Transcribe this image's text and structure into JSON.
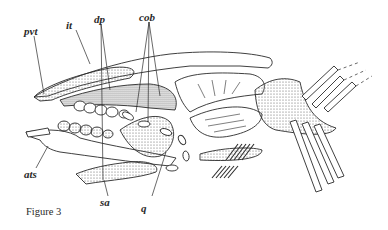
{
  "figure": {
    "caption": "Figure 3",
    "labels": [
      {
        "id": "pvt",
        "text": "pvt"
      },
      {
        "id": "it",
        "text": "it"
      },
      {
        "id": "dp",
        "text": "dp"
      },
      {
        "id": "cob",
        "text": "cob"
      },
      {
        "id": "ats",
        "text": "ats"
      },
      {
        "id": "sa",
        "text": "sa"
      },
      {
        "id": "q",
        "text": "q"
      }
    ]
  },
  "colors": {
    "ink": "#2a2a2a",
    "stipple": "#777777",
    "background": "#ffffff"
  }
}
